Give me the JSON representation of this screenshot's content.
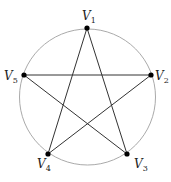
{
  "diagram": {
    "type": "pentagram-graph",
    "circle": {
      "cx": 87.5,
      "cy": 97,
      "r": 68,
      "stroke": "#aaaaaa"
    },
    "vertices": [
      {
        "id": "V1",
        "base": "V",
        "sub": "1",
        "x": 87,
        "y": 28,
        "lx": 82,
        "ly": 20
      },
      {
        "id": "V2",
        "base": "V",
        "sub": "2",
        "x": 151,
        "y": 75,
        "lx": 155,
        "ly": 80
      },
      {
        "id": "V3",
        "base": "V",
        "sub": "3",
        "x": 127,
        "y": 154,
        "lx": 134,
        "ly": 168
      },
      {
        "id": "V4",
        "base": "V",
        "sub": "4",
        "x": 48,
        "y": 154,
        "lx": 37,
        "ly": 168
      },
      {
        "id": "V5",
        "base": "V",
        "sub": "5",
        "x": 24,
        "y": 75,
        "lx": 4,
        "ly": 80
      }
    ],
    "edges": [
      [
        "V1",
        "V3"
      ],
      [
        "V1",
        "V4"
      ],
      [
        "V2",
        "V5"
      ],
      [
        "V2",
        "V4"
      ],
      [
        "V5",
        "V3"
      ]
    ],
    "edge_color": "#333333",
    "node_color": "#000000"
  }
}
